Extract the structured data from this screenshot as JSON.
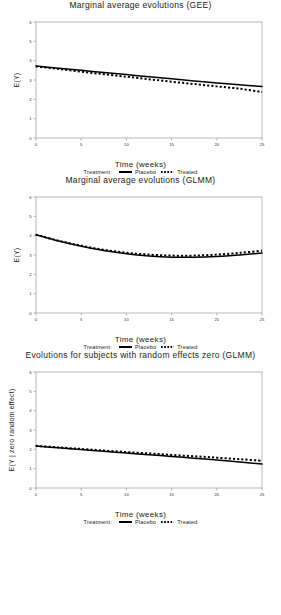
{
  "figure": {
    "axis_x_title": "Time (weeks)",
    "legend_label": "Treatment:",
    "legend_placebo": "Placebo",
    "legend_treated": "Treated",
    "line_color": "#000000"
  },
  "chart_data": [
    {
      "type": "line",
      "title": "Marginal average evolutions (GEE)",
      "xlabel": "Time (weeks)",
      "ylabel": "E(Y)",
      "xlim": [
        0,
        25
      ],
      "ylim": [
        0,
        6
      ],
      "xticks": [
        0,
        5,
        10,
        15,
        20,
        25
      ],
      "yticks": [
        0,
        1,
        2,
        3,
        4,
        5,
        6
      ],
      "grid": false,
      "legend_position": "below",
      "x": [
        0,
        2.5,
        5,
        7.5,
        10,
        12.5,
        15,
        17.5,
        20,
        22.5,
        25
      ],
      "series": [
        {
          "name": "Placebo",
          "style": "solid",
          "values": [
            3.72,
            3.61,
            3.5,
            3.39,
            3.28,
            3.17,
            3.06,
            2.95,
            2.85,
            2.75,
            2.66
          ]
        },
        {
          "name": "Treated",
          "style": "dotted",
          "values": [
            3.7,
            3.57,
            3.43,
            3.3,
            3.17,
            3.04,
            2.91,
            2.79,
            2.67,
            2.55,
            2.38
          ]
        }
      ]
    },
    {
      "type": "line",
      "title": "Marginal average evolutions (GLMM)",
      "xlabel": "Time (weeks)",
      "ylabel": "E(Y)",
      "xlim": [
        0,
        25
      ],
      "ylim": [
        0,
        6
      ],
      "xticks": [
        0,
        5,
        10,
        15,
        20,
        25
      ],
      "yticks": [
        0,
        1,
        2,
        3,
        4,
        5,
        6
      ],
      "grid": false,
      "legend_position": "below",
      "x": [
        0,
        2.5,
        5,
        7.5,
        10,
        12.5,
        15,
        17.5,
        20,
        22.5,
        25
      ],
      "series": [
        {
          "name": "Placebo",
          "style": "solid",
          "values": [
            4.05,
            3.72,
            3.45,
            3.23,
            3.06,
            2.95,
            2.89,
            2.88,
            2.92,
            3.0,
            3.1
          ]
        },
        {
          "name": "Treated",
          "style": "dotted",
          "values": [
            4.05,
            3.74,
            3.48,
            3.27,
            3.12,
            3.02,
            2.97,
            2.97,
            3.02,
            3.11,
            3.22
          ]
        }
      ]
    },
    {
      "type": "line",
      "title": "Evolutions for subjects with random effects zero (GLMM)",
      "xlabel": "Time (weeks)",
      "ylabel": "E(Y | zero random effect)",
      "xlim": [
        0,
        25
      ],
      "ylim": [
        0,
        6
      ],
      "xticks": [
        0,
        5,
        10,
        15,
        20,
        25
      ],
      "yticks": [
        0,
        1,
        2,
        3,
        4,
        5,
        6
      ],
      "grid": false,
      "legend_position": "below",
      "x": [
        0,
        2.5,
        5,
        7.5,
        10,
        12.5,
        15,
        17.5,
        20,
        22.5,
        25
      ],
      "series": [
        {
          "name": "Placebo",
          "style": "solid",
          "values": [
            2.17,
            2.08,
            1.99,
            1.9,
            1.81,
            1.72,
            1.63,
            1.54,
            1.45,
            1.35,
            1.24
          ]
        },
        {
          "name": "Treated",
          "style": "dotted",
          "values": [
            2.18,
            2.1,
            2.02,
            1.94,
            1.86,
            1.79,
            1.71,
            1.64,
            1.57,
            1.49,
            1.41
          ]
        }
      ]
    }
  ]
}
